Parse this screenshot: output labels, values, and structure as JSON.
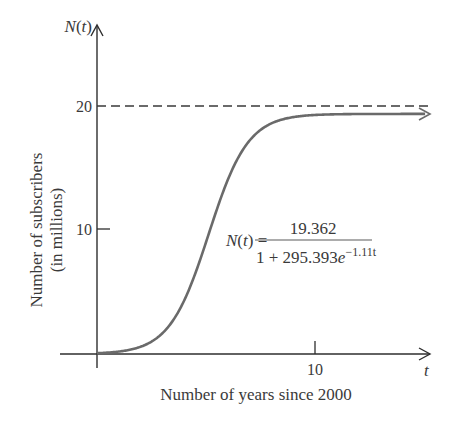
{
  "chart_data": {
    "type": "line",
    "title": "",
    "function_label": {
      "lhs": "N(t) =",
      "numerator": "19.362",
      "denominator_prefix": "1 + 295.393",
      "denominator_base": "e",
      "denominator_exponent": "−1.11t"
    },
    "model": {
      "L": 19.362,
      "A": 295.393,
      "k": 1.11
    },
    "xlabel": "Number of years since 2000",
    "ylabel_line1": "Number of subscribers",
    "ylabel_line2": "(in millions)",
    "x_axis_var": "t",
    "y_axis_var": "N(t)",
    "x_ticks": [
      {
        "value": 10,
        "label": "10"
      }
    ],
    "y_ticks": [
      {
        "value": 10,
        "label": "10"
      },
      {
        "value": 20,
        "label": "20"
      }
    ],
    "asymptote": {
      "y": 20,
      "style": "dashed"
    },
    "xlim": [
      0,
      13.5
    ],
    "ylim": [
      0,
      22
    ],
    "grid": false,
    "legend": null,
    "series": [
      {
        "name": "N(t)",
        "x": [
          0,
          1,
          2,
          3,
          4,
          5,
          6,
          7,
          8,
          9,
          10,
          11,
          12,
          13.2
        ],
        "values": [
          0.07,
          0.19,
          0.58,
          1.66,
          4.29,
          8.8,
          13.52,
          16.74,
          18.31,
          18.94,
          19.18,
          19.29,
          19.33,
          19.36
        ]
      }
    ],
    "colors": {
      "curve": "#6a6a6a",
      "axis": "#2e2e2e",
      "text": "#3a3a3a"
    }
  }
}
